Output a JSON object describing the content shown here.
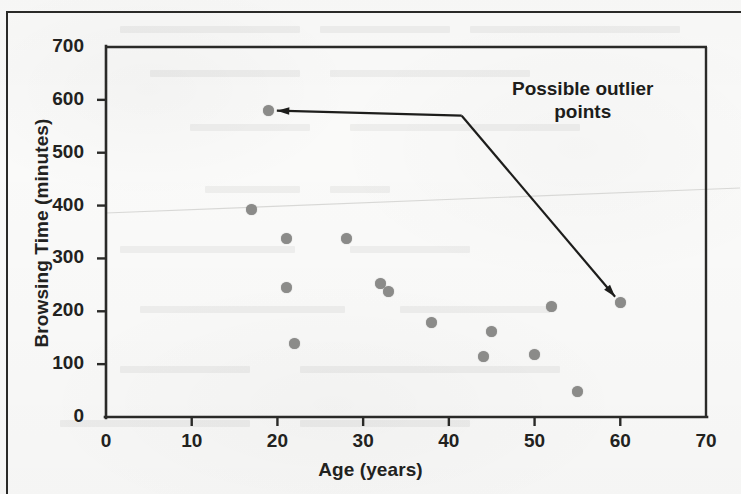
{
  "chart_data": {
    "type": "scatter",
    "title": "",
    "xlabel": "Age (years)",
    "ylabel": "Browsing Time (minutes)",
    "xlim": [
      0,
      70
    ],
    "ylim": [
      0,
      700
    ],
    "xticks": [
      0,
      10,
      20,
      30,
      40,
      50,
      60,
      70
    ],
    "yticks": [
      0,
      100,
      200,
      300,
      400,
      500,
      600,
      700
    ],
    "grid": false,
    "legend": null,
    "point_color": "#8b8b89",
    "axis_color": "#2a2a28",
    "series": [
      {
        "name": "Browsing time by age",
        "points": [
          {
            "x": 17,
            "y": 392
          },
          {
            "x": 19,
            "y": 580
          },
          {
            "x": 21,
            "y": 337
          },
          {
            "x": 21,
            "y": 245
          },
          {
            "x": 22,
            "y": 139
          },
          {
            "x": 28,
            "y": 337
          },
          {
            "x": 32,
            "y": 252
          },
          {
            "x": 33,
            "y": 237
          },
          {
            "x": 38,
            "y": 179
          },
          {
            "x": 44,
            "y": 114
          },
          {
            "x": 45,
            "y": 161
          },
          {
            "x": 50,
            "y": 118
          },
          {
            "x": 52,
            "y": 210
          },
          {
            "x": 55,
            "y": 48
          },
          {
            "x": 60,
            "y": 216
          }
        ]
      }
    ],
    "annotations": [
      {
        "text": "Possible outlier\npoints",
        "label_x": 41.5,
        "label_y": 620,
        "targets": [
          {
            "x": 19,
            "y": 580
          },
          {
            "x": 60,
            "y": 216
          }
        ]
      }
    ]
  }
}
